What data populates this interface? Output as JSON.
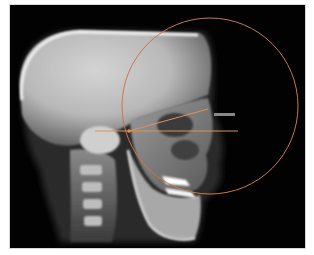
{
  "image": {
    "subject": "Lateral cephalometric radiograph with tracing",
    "background_color": "#020202",
    "annotation_color": "#c8784a"
  },
  "annotations": {
    "circle": {
      "cx": 210,
      "cy": 106,
      "r": 88
    },
    "horizontal_line": {
      "x1": 95,
      "y1": 131,
      "x2": 238,
      "y2": 131
    },
    "angled_line": {
      "x1": 129,
      "y1": 131,
      "x2": 208,
      "y2": 109
    },
    "node": {
      "cx": 129,
      "cy": 131
    }
  }
}
